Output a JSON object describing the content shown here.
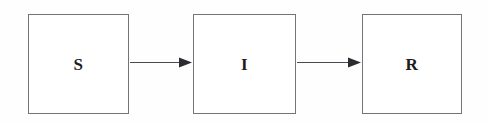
{
  "diagram": {
    "type": "flow-diagram",
    "canvas": {
      "width": 488,
      "height": 124,
      "background": "#fefefe"
    },
    "style": {
      "box_fill": "#ffffff",
      "box_border_color": "#73737a",
      "box_border_width": 1,
      "arrow_color": "#4a4a50",
      "arrow_head_color": "#2b2b30",
      "label_color": "#1c1c1c"
    },
    "nodes": [
      {
        "id": "S",
        "label": "S",
        "name": "susceptible",
        "x": 28,
        "y": 14,
        "width": 101,
        "height": 100
      },
      {
        "id": "I",
        "label": "I",
        "name": "infected",
        "x": 193,
        "y": 14,
        "width": 103,
        "height": 100
      },
      {
        "id": "R",
        "label": "R",
        "name": "recovered",
        "x": 362,
        "y": 14,
        "width": 100,
        "height": 100
      }
    ],
    "edges": [
      {
        "id": "S-to-I",
        "from": "S",
        "to": "I",
        "label": "",
        "x1": 130,
        "x2": 192,
        "y": 62
      },
      {
        "id": "I-to-R",
        "from": "I",
        "to": "R",
        "label": "",
        "x1": 297,
        "x2": 361,
        "y": 62
      }
    ]
  }
}
